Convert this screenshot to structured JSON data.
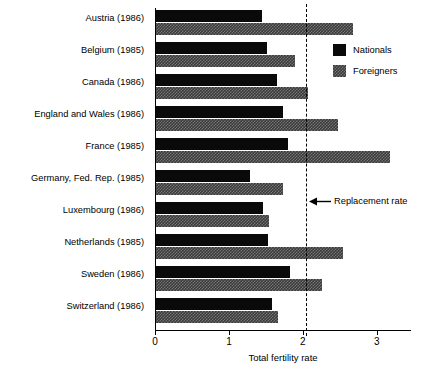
{
  "chart_data": {
    "type": "bar",
    "orientation": "horizontal",
    "title": "",
    "xlabel": "Total fertility rate",
    "ylabel": "",
    "xlim": [
      0,
      3.45
    ],
    "xticks": [
      0,
      1,
      2,
      3
    ],
    "xtick_labels": [
      "0",
      "1",
      "2",
      "3"
    ],
    "grid": false,
    "legend_position": "upper right",
    "categories": [
      "Austria (1986)",
      "Belgium (1985)",
      "Canada (1986)",
      "England and Wales (1986)",
      "France (1985)",
      "Germany, Fed. Rep. (1985)",
      "Luxembourg (1986)",
      "Netherlands (1985)",
      "Sweden (1986)",
      "Switzerland (1986)"
    ],
    "series": [
      {
        "name": "Nationals",
        "color": "#0a0a0a",
        "values": [
          1.45,
          1.51,
          1.65,
          1.73,
          1.8,
          1.28,
          1.46,
          1.53,
          1.82,
          1.58
        ]
      },
      {
        "name": "Foreigners",
        "color": "#3a3a3a",
        "values": [
          2.68,
          1.89,
          2.07,
          2.47,
          3.18,
          1.73,
          1.54,
          2.54,
          2.26,
          1.66
        ]
      }
    ],
    "annotations": [
      {
        "label": "Replacement rate",
        "value": 2.04,
        "style": "dashed-vertical-line-with-arrow"
      }
    ]
  },
  "legend": {
    "items": [
      {
        "label": "Nationals",
        "swatch": "solid-black-square"
      },
      {
        "label": "Foreigners",
        "swatch": "checkered-gray-square"
      }
    ]
  },
  "annotation": {
    "replacement_rate_label": "Replacement rate",
    "arrow_icon": "left-arrow-icon"
  },
  "axis": {
    "x_title": "Total fertility rate",
    "ticks": [
      "0",
      "1",
      "2",
      "3"
    ]
  }
}
